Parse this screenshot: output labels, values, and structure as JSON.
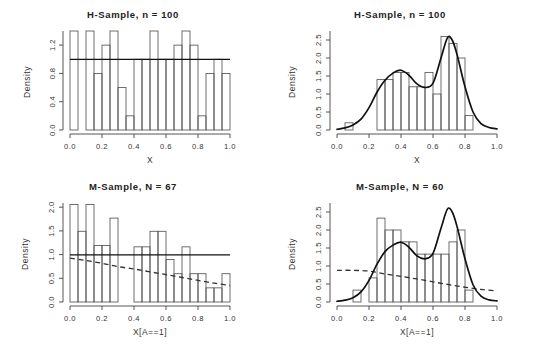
{
  "figure": {
    "layout": "2x2 grid of R base-graphics histogram panels",
    "background": "#ffffff",
    "ink_color": "#111111"
  },
  "chart_data": [
    {
      "id": "top-left",
      "type": "bar",
      "title": "H-Sample,  n =  100",
      "xlabel": "X",
      "ylabel": "Density",
      "xlim": [
        0.0,
        1.0
      ],
      "ylim": [
        0.0,
        1.4
      ],
      "xticks": [
        "0.0",
        "0.2",
        "0.4",
        "0.6",
        "0.8",
        "1.0"
      ],
      "xtick_values": [
        0.0,
        0.2,
        0.4,
        0.6,
        0.8,
        1.0
      ],
      "yticks": [
        "0.0",
        "0.4",
        "0.8",
        "1.2"
      ],
      "ytick_values": [
        0.0,
        0.4,
        0.8,
        1.2
      ],
      "grid": false,
      "legend": "none",
      "bin_width": 0.05,
      "bin_edges": [
        0.0,
        0.05,
        0.1,
        0.15,
        0.2,
        0.25,
        0.3,
        0.35,
        0.4,
        0.45,
        0.5,
        0.55,
        0.6,
        0.65,
        0.7,
        0.75,
        0.8,
        0.85,
        0.9,
        0.95,
        1.0
      ],
      "values": [
        1.4,
        0.0,
        1.4,
        0.8,
        1.2,
        1.4,
        0.6,
        0.2,
        1.0,
        1.0,
        1.4,
        1.0,
        1.0,
        1.2,
        1.4,
        1.2,
        0.2,
        0.8,
        1.0,
        0.8
      ],
      "reference_line": {
        "type": "horizontal",
        "value": 1.0,
        "style": "solid",
        "label": "uniform density = 1"
      },
      "annotations": []
    },
    {
      "id": "top-right",
      "type": "bar",
      "title": "H-Sample,  n =  100",
      "xlabel": "X",
      "ylabel": "Density",
      "xlim": [
        0.0,
        1.0
      ],
      "ylim": [
        0.0,
        2.75
      ],
      "xticks": [
        "0.0",
        "0.2",
        "0.4",
        "0.6",
        "0.8",
        "1.0"
      ],
      "xtick_values": [
        0.0,
        0.2,
        0.4,
        0.6,
        0.8,
        1.0
      ],
      "yticks": [
        "0.0",
        "0.5",
        "1.0",
        "1.5",
        "2.0",
        "2.5"
      ],
      "ytick_values": [
        0.0,
        0.5,
        1.0,
        1.5,
        2.0,
        2.5
      ],
      "grid": false,
      "legend": "none",
      "bin_width": 0.05,
      "bin_edges": [
        0.05,
        0.1,
        0.15,
        0.2,
        0.25,
        0.3,
        0.35,
        0.4,
        0.45,
        0.5,
        0.55,
        0.6,
        0.65,
        0.7,
        0.75,
        0.8,
        0.85
      ],
      "values": [
        0.2,
        0.0,
        0.0,
        0.0,
        1.4,
        1.4,
        1.6,
        1.6,
        1.2,
        1.2,
        1.6,
        1.0,
        2.6,
        2.4,
        2.0,
        0.4
      ],
      "density_curve": {
        "style": "solid",
        "description": "bimodal kernel density estimate with modes near x=0.40 and x=0.69",
        "points": [
          [
            0.0,
            0.02
          ],
          [
            0.05,
            0.06
          ],
          [
            0.1,
            0.14
          ],
          [
            0.15,
            0.3
          ],
          [
            0.2,
            0.62
          ],
          [
            0.25,
            1.05
          ],
          [
            0.3,
            1.38
          ],
          [
            0.35,
            1.58
          ],
          [
            0.4,
            1.66
          ],
          [
            0.45,
            1.52
          ],
          [
            0.5,
            1.28
          ],
          [
            0.55,
            1.18
          ],
          [
            0.6,
            1.3
          ],
          [
            0.65,
            2.0
          ],
          [
            0.69,
            2.56
          ],
          [
            0.72,
            2.5
          ],
          [
            0.75,
            2.1
          ],
          [
            0.8,
            1.2
          ],
          [
            0.85,
            0.5
          ],
          [
            0.9,
            0.18
          ],
          [
            0.95,
            0.07
          ],
          [
            1.0,
            0.03
          ]
        ]
      },
      "annotations": []
    },
    {
      "id": "bottom-left",
      "type": "bar",
      "title": "M-Sample,  N =  67",
      "xlabel": "X[A==1]",
      "ylabel": "Density",
      "xlim": [
        0.0,
        1.0
      ],
      "ylim": [
        0.0,
        2.1
      ],
      "xticks": [
        "0.0",
        "0.2",
        "0.4",
        "0.6",
        "0.8",
        "1.0"
      ],
      "xtick_values": [
        0.0,
        0.2,
        0.4,
        0.6,
        0.8,
        1.0
      ],
      "yticks": [
        "0.0",
        "0.5",
        "1.0",
        "1.5",
        "2.0"
      ],
      "ytick_values": [
        0.0,
        0.5,
        1.0,
        1.5,
        2.0
      ],
      "grid": false,
      "legend": "none",
      "bin_width": 0.05,
      "bin_edges": [
        0.0,
        0.05,
        0.1,
        0.15,
        0.2,
        0.25,
        0.3,
        0.35,
        0.4,
        0.45,
        0.5,
        0.55,
        0.6,
        0.65,
        0.7,
        0.75,
        0.8,
        0.85,
        0.9,
        0.95,
        1.0
      ],
      "values": [
        2.07,
        1.5,
        2.07,
        1.2,
        1.2,
        1.78,
        0.0,
        0.0,
        1.17,
        1.17,
        1.5,
        1.5,
        0.9,
        0.6,
        1.17,
        0.6,
        0.6,
        0.3,
        0.3,
        0.6,
        0.3
      ],
      "reference_line": {
        "type": "horizontal",
        "value": 1.0,
        "style": "solid",
        "label": "uniform density = 1"
      },
      "dashed_curve": {
        "style": "dashed",
        "description": "monotone decreasing fitted propensity/weight curve",
        "points": [
          [
            0.0,
            0.93
          ],
          [
            0.1,
            0.88
          ],
          [
            0.2,
            0.82
          ],
          [
            0.3,
            0.75
          ],
          [
            0.4,
            0.7
          ],
          [
            0.5,
            0.64
          ],
          [
            0.6,
            0.58
          ],
          [
            0.7,
            0.52
          ],
          [
            0.8,
            0.46
          ],
          [
            0.9,
            0.4
          ],
          [
            1.0,
            0.35
          ]
        ]
      },
      "annotations": []
    },
    {
      "id": "bottom-right",
      "type": "bar",
      "title": "M-Sample,  N =  60",
      "xlabel": "X[A==1]",
      "ylabel": "Density",
      "xlim": [
        0.0,
        1.0
      ],
      "ylim": [
        0.0,
        2.75
      ],
      "xticks": [
        "0.0",
        "0.2",
        "0.4",
        "0.6",
        "0.8",
        "1.0"
      ],
      "xtick_values": [
        0.0,
        0.2,
        0.4,
        0.6,
        0.8,
        1.0
      ],
      "yticks": [
        "0.0",
        "0.5",
        "1.0",
        "1.5",
        "2.0",
        "2.5"
      ],
      "ytick_values": [
        0.0,
        0.5,
        1.0,
        1.5,
        2.0,
        2.5
      ],
      "grid": false,
      "legend": "none",
      "bin_width": 0.05,
      "bin_edges": [
        0.1,
        0.15,
        0.2,
        0.25,
        0.3,
        0.35,
        0.4,
        0.45,
        0.5,
        0.55,
        0.6,
        0.65,
        0.7,
        0.75,
        0.8,
        0.85
      ],
      "values": [
        0.33,
        0.0,
        0.67,
        2.33,
        2.0,
        2.0,
        1.67,
        1.67,
        1.33,
        1.33,
        1.33,
        1.33,
        1.67,
        2.0,
        0.33
      ],
      "density_curve": {
        "style": "solid",
        "description": "bimodal kernel density estimate with modes near x=0.40 and x=0.69",
        "points": [
          [
            0.0,
            0.02
          ],
          [
            0.05,
            0.05
          ],
          [
            0.1,
            0.12
          ],
          [
            0.15,
            0.28
          ],
          [
            0.2,
            0.6
          ],
          [
            0.25,
            1.05
          ],
          [
            0.3,
            1.4
          ],
          [
            0.35,
            1.58
          ],
          [
            0.4,
            1.66
          ],
          [
            0.45,
            1.52
          ],
          [
            0.5,
            1.28
          ],
          [
            0.55,
            1.2
          ],
          [
            0.6,
            1.35
          ],
          [
            0.65,
            2.05
          ],
          [
            0.69,
            2.58
          ],
          [
            0.72,
            2.5
          ],
          [
            0.75,
            2.1
          ],
          [
            0.8,
            1.2
          ],
          [
            0.85,
            0.48
          ],
          [
            0.9,
            0.16
          ],
          [
            0.95,
            0.06
          ],
          [
            1.0,
            0.03
          ]
        ]
      },
      "dashed_curve": {
        "style": "dashed",
        "description": "flat-then-decreasing fitted weight curve starting near 0.88",
        "points": [
          [
            0.0,
            0.88
          ],
          [
            0.1,
            0.88
          ],
          [
            0.2,
            0.86
          ],
          [
            0.25,
            0.82
          ],
          [
            0.3,
            0.78
          ],
          [
            0.4,
            0.71
          ],
          [
            0.5,
            0.64
          ],
          [
            0.6,
            0.56
          ],
          [
            0.7,
            0.48
          ],
          [
            0.8,
            0.41
          ],
          [
            0.9,
            0.35
          ],
          [
            1.0,
            0.31
          ]
        ]
      },
      "annotations": []
    }
  ]
}
